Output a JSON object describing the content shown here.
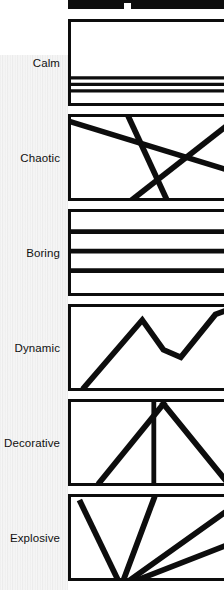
{
  "page": {
    "background_color": "#ffffff",
    "ink_color": "#0d0d0d",
    "texture": "vertical-stripe-paper"
  },
  "top_cropped_panel": {
    "note": "cropped bottom edge of the preceding panel",
    "fill_color": "#0d0d0d"
  },
  "rows": [
    {
      "label": "Calm",
      "drawing": {
        "type": "horizontal-lines-clustered-low",
        "description": "three thin horizontal lines tightly grouped near the bottom of an otherwise empty frame",
        "lines": [
          {
            "x1": 0,
            "y1": 60,
            "x2": 162,
            "y2": 60,
            "width": 3.5
          },
          {
            "x1": 0,
            "y1": 67,
            "x2": 162,
            "y2": 67,
            "width": 3.5
          },
          {
            "x1": 0,
            "y1": 74,
            "x2": 162,
            "y2": 74,
            "width": 3.5
          }
        ]
      }
    },
    {
      "label": "Chaotic",
      "drawing": {
        "type": "crossing-diagonals",
        "description": "three long diagonals crossing at irregular angles",
        "lines": [
          {
            "x1": -4,
            "y1": 4,
            "x2": 166,
            "y2": 58,
            "width": 6
          },
          {
            "x1": 58,
            "y1": -4,
            "x2": 100,
            "y2": 90,
            "width": 6
          },
          {
            "x1": 166,
            "y1": 6,
            "x2": 62,
            "y2": 90,
            "width": 6
          }
        ]
      }
    },
    {
      "label": "Boring",
      "drawing": {
        "type": "horizontal-lines-even",
        "description": "three evenly spaced horizontal lines dividing the frame into equal bands",
        "lines": [
          {
            "x1": 0,
            "y1": 21,
            "x2": 162,
            "y2": 21,
            "width": 5
          },
          {
            "x1": 0,
            "y1": 42,
            "x2": 162,
            "y2": 42,
            "width": 5
          },
          {
            "x1": 0,
            "y1": 63,
            "x2": 162,
            "y2": 63,
            "width": 5
          }
        ]
      }
    },
    {
      "label": "Dynamic",
      "drawing": {
        "type": "zigzag-polyline",
        "description": "rising zigzag peaking high, dipping, then rising off the right edge",
        "points": "14,86 74,14 96,46 114,54 150,8 166,2",
        "width": 6
      }
    },
    {
      "label": "Decorative",
      "drawing": {
        "type": "symmetric-cross-with-axis",
        "description": "two mirrored diagonals crossing near the top plus a central vertical axis",
        "lines": [
          {
            "x1": 30,
            "y1": 86,
            "x2": 96,
            "y2": 2,
            "width": 6
          },
          {
            "x1": 162,
            "y1": 86,
            "x2": 96,
            "y2": 2,
            "width": 6
          },
          {
            "x1": 86,
            "y1": 0,
            "x2": 86,
            "y2": 86,
            "width": 5
          }
        ]
      }
    },
    {
      "label": "Explosive",
      "drawing": {
        "type": "radiating-fan",
        "description": "lines radiating outward from a low-left focal point, frame cropped at bottom",
        "lines": [
          {
            "x1": 52,
            "y1": 96,
            "x2": 10,
            "y2": 6,
            "width": 6
          },
          {
            "x1": 52,
            "y1": 96,
            "x2": 86,
            "y2": 2,
            "width": 6
          },
          {
            "x1": 52,
            "y1": 96,
            "x2": 166,
            "y2": 12,
            "width": 6
          },
          {
            "x1": 52,
            "y1": 96,
            "x2": 166,
            "y2": 50,
            "width": 6
          }
        ]
      }
    }
  ]
}
